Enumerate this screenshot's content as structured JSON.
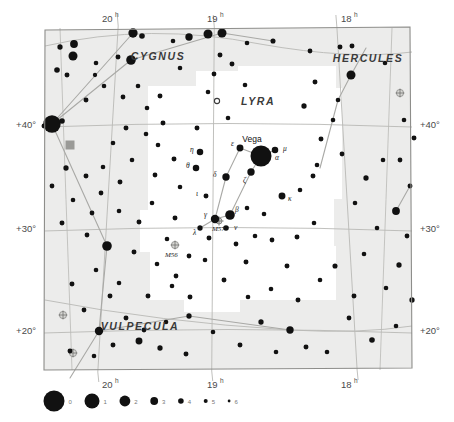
{
  "chart_data": {
    "type": "scatter",
    "xlabel": "Right Ascension",
    "ylabel": "Declination",
    "xlim": [
      20.5,
      17.5
    ],
    "ylim": [
      16,
      46
    ],
    "grid": true,
    "ra_ticks": [
      {
        "value": 20,
        "label": "20",
        "sup": "h",
        "x": 108
      },
      {
        "value": 19,
        "label": "19",
        "sup": "h",
        "x": 213
      },
      {
        "value": 18,
        "label": "18",
        "sup": "h",
        "x": 347
      }
    ],
    "dec_ticks": [
      {
        "value": 40,
        "label": "+40°",
        "y": 124
      },
      {
        "value": 30,
        "label": "+30°",
        "y": 228
      },
      {
        "value": 20,
        "label": "+20°",
        "y": 330
      }
    ],
    "constellations": [
      {
        "name": "CYGNUS",
        "x": 158,
        "y": 60
      },
      {
        "name": "HERCULES",
        "x": 368,
        "y": 62
      },
      {
        "name": "LYRA",
        "x": 258,
        "y": 105
      },
      {
        "name": "VULPECULA",
        "x": 140,
        "y": 330
      }
    ],
    "named_stars": [
      {
        "name": "Vega",
        "label": "α",
        "x": 261,
        "y": 156,
        "mag": 0,
        "label_x": 252,
        "label_y": 142,
        "greek_x": 275,
        "greek_y": 160
      }
    ],
    "greek_labels": [
      {
        "text": "η",
        "x": 190,
        "y": 152
      },
      {
        "text": "θ",
        "x": 186,
        "y": 168
      },
      {
        "text": "ι",
        "x": 196,
        "y": 196
      },
      {
        "text": "δ",
        "x": 213,
        "y": 177
      },
      {
        "text": "ε",
        "x": 231,
        "y": 146
      },
      {
        "text": "μ",
        "x": 283,
        "y": 151
      },
      {
        "text": "ζ",
        "x": 243,
        "y": 183
      },
      {
        "text": "κ",
        "x": 288,
        "y": 201
      },
      {
        "text": "γ",
        "x": 204,
        "y": 217
      },
      {
        "text": "β",
        "x": 235,
        "y": 212
      },
      {
        "text": "ν",
        "x": 234,
        "y": 230
      },
      {
        "text": "λ",
        "x": 193,
        "y": 235
      }
    ],
    "deep_sky": [
      {
        "name": "M57",
        "type": "planetary-nebula",
        "x": 219,
        "y": 221,
        "label_x": 212,
        "label_y": 231
      },
      {
        "name": "M56",
        "type": "globular-cluster",
        "x": 175,
        "y": 245,
        "label_x": 165,
        "label_y": 257
      }
    ],
    "legend": {
      "title": "magnitude",
      "items": [
        {
          "mag": "0",
          "r": 10.5
        },
        {
          "mag": "1",
          "r": 7.5
        },
        {
          "mag": "2",
          "r": 5.4
        },
        {
          "mag": "3",
          "r": 3.9
        },
        {
          "mag": "4",
          "r": 2.8
        },
        {
          "mag": "5",
          "r": 2.0
        },
        {
          "mag": "6",
          "r": 1.4
        }
      ]
    },
    "colors": {
      "background": "#ffffff",
      "sky_fill": "#ececeb",
      "inset_fill": "#ffffff",
      "star": "#111111",
      "grid": "#b9b9b5",
      "constellation_line": "#a9a9a6",
      "border": "#8d8d8a",
      "open_cluster": "#9a9a97",
      "text": "#2b2b2b"
    },
    "stars": [
      {
        "x": 52,
        "y": 124,
        "m": 0.6
      },
      {
        "x": 44,
        "y": 126,
        "m": 4.4
      },
      {
        "x": 62,
        "y": 121,
        "m": 4.0
      },
      {
        "x": 60,
        "y": 47,
        "m": 4.2
      },
      {
        "x": 74,
        "y": 44,
        "m": 3.0
      },
      {
        "x": 73,
        "y": 56,
        "m": 2.6
      },
      {
        "x": 57,
        "y": 70,
        "m": 4.0
      },
      {
        "x": 67,
        "y": 75,
        "m": 4.4
      },
      {
        "x": 96,
        "y": 63,
        "m": 4.6
      },
      {
        "x": 95,
        "y": 75,
        "m": 4.8
      },
      {
        "x": 118,
        "y": 57,
        "m": 4.4
      },
      {
        "x": 131,
        "y": 60,
        "m": 2.4
      },
      {
        "x": 133,
        "y": 33,
        "m": 2.5
      },
      {
        "x": 142,
        "y": 36,
        "m": 4.0
      },
      {
        "x": 173,
        "y": 41,
        "m": 4.6
      },
      {
        "x": 189,
        "y": 37,
        "m": 3.2
      },
      {
        "x": 208,
        "y": 34,
        "m": 2.6
      },
      {
        "x": 222,
        "y": 33,
        "m": 2.6
      },
      {
        "x": 220,
        "y": 55,
        "m": 4.4
      },
      {
        "x": 247,
        "y": 43,
        "m": 4.6
      },
      {
        "x": 273,
        "y": 41,
        "m": 4.3
      },
      {
        "x": 310,
        "y": 51,
        "m": 4.5
      },
      {
        "x": 340,
        "y": 47,
        "m": 4.4
      },
      {
        "x": 352,
        "y": 46,
        "m": 4.4
      },
      {
        "x": 385,
        "y": 63,
        "m": 4.6
      },
      {
        "x": 351,
        "y": 75,
        "m": 2.6
      },
      {
        "x": 315,
        "y": 82,
        "m": 4.4
      },
      {
        "x": 338,
        "y": 100,
        "m": 4.6
      },
      {
        "x": 304,
        "y": 106,
        "m": 4.2
      },
      {
        "x": 404,
        "y": 120,
        "m": 4.6
      },
      {
        "x": 414,
        "y": 138,
        "m": 4.4
      },
      {
        "x": 400,
        "y": 160,
        "m": 4.5
      },
      {
        "x": 410,
        "y": 186,
        "m": 4.4
      },
      {
        "x": 396,
        "y": 211,
        "m": 3.0
      },
      {
        "x": 407,
        "y": 236,
        "m": 4.5
      },
      {
        "x": 399,
        "y": 265,
        "m": 4.2
      },
      {
        "x": 386,
        "y": 288,
        "m": 4.6
      },
      {
        "x": 412,
        "y": 300,
        "m": 4.2
      },
      {
        "x": 396,
        "y": 326,
        "m": 4.6
      },
      {
        "x": 372,
        "y": 340,
        "m": 4.0
      },
      {
        "x": 349,
        "y": 318,
        "m": 4.5
      },
      {
        "x": 354,
        "y": 296,
        "m": 4.4
      },
      {
        "x": 335,
        "y": 266,
        "m": 4.3
      },
      {
        "x": 364,
        "y": 254,
        "m": 4.6
      },
      {
        "x": 377,
        "y": 228,
        "m": 4.6
      },
      {
        "x": 355,
        "y": 203,
        "m": 4.6
      },
      {
        "x": 366,
        "y": 178,
        "m": 4.2
      },
      {
        "x": 383,
        "y": 160,
        "m": 4.6
      },
      {
        "x": 342,
        "y": 154,
        "m": 4.5
      },
      {
        "x": 321,
        "y": 139,
        "m": 4.4
      },
      {
        "x": 333,
        "y": 120,
        "m": 4.6
      },
      {
        "x": 313,
        "y": 176,
        "m": 4.4
      },
      {
        "x": 317,
        "y": 165,
        "m": 4.6
      },
      {
        "x": 300,
        "y": 190,
        "m": 4.6
      },
      {
        "x": 297,
        "y": 237,
        "m": 4.4
      },
      {
        "x": 314,
        "y": 223,
        "m": 4.6
      },
      {
        "x": 287,
        "y": 266,
        "m": 4.4
      },
      {
        "x": 320,
        "y": 280,
        "m": 4.6
      },
      {
        "x": 298,
        "y": 300,
        "m": 4.4
      },
      {
        "x": 271,
        "y": 289,
        "m": 4.6
      },
      {
        "x": 261,
        "y": 322,
        "m": 4.2
      },
      {
        "x": 290,
        "y": 330,
        "m": 3.2
      },
      {
        "x": 306,
        "y": 347,
        "m": 4.4
      },
      {
        "x": 327,
        "y": 352,
        "m": 4.6
      },
      {
        "x": 276,
        "y": 352,
        "m": 4.6
      },
      {
        "x": 240,
        "y": 345,
        "m": 4.4
      },
      {
        "x": 213,
        "y": 332,
        "m": 4.6
      },
      {
        "x": 186,
        "y": 354,
        "m": 4.4
      },
      {
        "x": 160,
        "y": 348,
        "m": 4.2
      },
      {
        "x": 139,
        "y": 341,
        "m": 3.4
      },
      {
        "x": 113,
        "y": 345,
        "m": 4.4
      },
      {
        "x": 94,
        "y": 356,
        "m": 4.6
      },
      {
        "x": 70,
        "y": 351,
        "m": 4.4
      },
      {
        "x": 99,
        "y": 331,
        "m": 2.8
      },
      {
        "x": 126,
        "y": 318,
        "m": 4.4
      },
      {
        "x": 144,
        "y": 330,
        "m": 4.5
      },
      {
        "x": 166,
        "y": 322,
        "m": 4.6
      },
      {
        "x": 189,
        "y": 316,
        "m": 4.2
      },
      {
        "x": 110,
        "y": 296,
        "m": 4.4
      },
      {
        "x": 84,
        "y": 310,
        "m": 4.5
      },
      {
        "x": 72,
        "y": 284,
        "m": 4.4
      },
      {
        "x": 96,
        "y": 270,
        "m": 4.6
      },
      {
        "x": 119,
        "y": 283,
        "m": 4.6
      },
      {
        "x": 148,
        "y": 296,
        "m": 4.4
      },
      {
        "x": 172,
        "y": 286,
        "m": 4.6
      },
      {
        "x": 190,
        "y": 297,
        "m": 4.4
      },
      {
        "x": 157,
        "y": 264,
        "m": 4.6
      },
      {
        "x": 134,
        "y": 252,
        "m": 4.4
      },
      {
        "x": 107,
        "y": 246,
        "m": 2.4
      },
      {
        "x": 87,
        "y": 235,
        "m": 4.5
      },
      {
        "x": 62,
        "y": 223,
        "m": 4.4
      },
      {
        "x": 73,
        "y": 200,
        "m": 4.6
      },
      {
        "x": 92,
        "y": 213,
        "m": 4.5
      },
      {
        "x": 52,
        "y": 186,
        "m": 4.5
      },
      {
        "x": 66,
        "y": 168,
        "m": 4.2
      },
      {
        "x": 86,
        "y": 176,
        "m": 4.4
      },
      {
        "x": 103,
        "y": 167,
        "m": 4.6
      },
      {
        "x": 120,
        "y": 182,
        "m": 4.4
      },
      {
        "x": 101,
        "y": 193,
        "m": 4.5
      },
      {
        "x": 132,
        "y": 160,
        "m": 4.6
      },
      {
        "x": 113,
        "y": 143,
        "m": 4.6
      },
      {
        "x": 126,
        "y": 128,
        "m": 4.4
      },
      {
        "x": 146,
        "y": 134,
        "m": 4.6
      },
      {
        "x": 163,
        "y": 123,
        "m": 4.4
      },
      {
        "x": 147,
        "y": 108,
        "m": 4.6
      },
      {
        "x": 123,
        "y": 97,
        "m": 4.5
      },
      {
        "x": 104,
        "y": 86,
        "m": 4.6
      },
      {
        "x": 86,
        "y": 100,
        "m": 4.4
      },
      {
        "x": 138,
        "y": 86,
        "m": 4.6
      },
      {
        "x": 160,
        "y": 96,
        "m": 4.4
      },
      {
        "x": 152,
        "y": 203,
        "m": 4.6
      },
      {
        "x": 139,
        "y": 222,
        "m": 4.4
      },
      {
        "x": 119,
        "y": 211,
        "m": 4.6
      },
      {
        "x": 155,
        "y": 175,
        "m": 4.5
      },
      {
        "x": 174,
        "y": 159,
        "m": 4.4
      },
      {
        "x": 180,
        "y": 187,
        "m": 4.6
      },
      {
        "x": 208,
        "y": 92,
        "m": 4.6
      },
      {
        "x": 197,
        "y": 128,
        "m": 4.4
      },
      {
        "x": 228,
        "y": 118,
        "m": 4.6
      },
      {
        "x": 214,
        "y": 74,
        "m": 4.5
      },
      {
        "x": 245,
        "y": 85,
        "m": 4.6
      },
      {
        "x": 232,
        "y": 64,
        "m": 4.4
      },
      {
        "x": 180,
        "y": 68,
        "m": 4.6
      },
      {
        "x": 200,
        "y": 152,
        "m": 3.6
      },
      {
        "x": 196,
        "y": 168,
        "m": 3.6
      },
      {
        "x": 206,
        "y": 196,
        "m": 4.4
      },
      {
        "x": 226,
        "y": 177,
        "m": 3.2
      },
      {
        "x": 240,
        "y": 148,
        "m": 3.4
      },
      {
        "x": 275,
        "y": 150,
        "m": 3.6
      },
      {
        "x": 251,
        "y": 172,
        "m": 3.2
      },
      {
        "x": 282,
        "y": 196,
        "m": 3.4
      },
      {
        "x": 215,
        "y": 219,
        "m": 2.8
      },
      {
        "x": 230,
        "y": 215,
        "m": 2.4
      },
      {
        "x": 226,
        "y": 228,
        "m": 4.0
      },
      {
        "x": 200,
        "y": 228,
        "m": 4.2
      },
      {
        "x": 209,
        "y": 238,
        "m": 4.4
      },
      {
        "x": 236,
        "y": 244,
        "m": 4.5
      },
      {
        "x": 255,
        "y": 236,
        "m": 4.6
      },
      {
        "x": 175,
        "y": 218,
        "m": 4.4
      },
      {
        "x": 167,
        "y": 239,
        "m": 4.6
      },
      {
        "x": 189,
        "y": 256,
        "m": 4.5
      },
      {
        "x": 246,
        "y": 262,
        "m": 4.4
      },
      {
        "x": 264,
        "y": 214,
        "m": 4.6
      },
      {
        "x": 272,
        "y": 240,
        "m": 4.5
      },
      {
        "x": 158,
        "y": 145,
        "m": 4.6
      },
      {
        "x": 247,
        "y": 208,
        "m": 4.6
      },
      {
        "x": 205,
        "y": 260,
        "m": 4.6
      },
      {
        "x": 224,
        "y": 280,
        "m": 4.4
      },
      {
        "x": 248,
        "y": 297,
        "m": 4.6
      },
      {
        "x": 176,
        "y": 276,
        "m": 4.5
      }
    ],
    "variable_stars": [
      {
        "x": 217,
        "y": 101,
        "r": 2.6
      }
    ],
    "open_clusters": [
      {
        "x": 70,
        "y": 145,
        "size": 9
      }
    ],
    "globular_clusters": [
      {
        "x": 175,
        "y": 245
      },
      {
        "x": 73,
        "y": 353
      },
      {
        "x": 400,
        "y": 93
      },
      {
        "x": 63,
        "y": 315
      }
    ],
    "constellation_lines": [
      [
        [
          52,
          124
        ],
        [
          133,
          33
        ]
      ],
      [
        [
          52,
          124
        ],
        [
          131,
          60
        ]
      ],
      [
        [
          52,
          124
        ],
        [
          107,
          246
        ]
      ],
      [
        [
          107,
          246
        ],
        [
          99,
          331
        ]
      ],
      [
        [
          99,
          331
        ],
        [
          70,
          378
        ]
      ],
      [
        [
          131,
          60
        ],
        [
          222,
          33
        ]
      ],
      [
        [
          222,
          33
        ],
        [
          273,
          41
        ]
      ],
      [
        [
          351,
          75
        ],
        [
          338,
          100
        ]
      ],
      [
        [
          338,
          100
        ],
        [
          320,
          168
        ]
      ],
      [
        [
          351,
          75
        ],
        [
          366,
          48
        ]
      ],
      [
        [
          396,
          211
        ],
        [
          410,
          186
        ]
      ],
      [
        [
          261,
          156
        ],
        [
          240,
          148
        ]
      ],
      [
        [
          240,
          148
        ],
        [
          226,
          177
        ]
      ],
      [
        [
          226,
          177
        ],
        [
          215,
          219
        ]
      ],
      [
        [
          215,
          219
        ],
        [
          230,
          215
        ]
      ],
      [
        [
          230,
          215
        ],
        [
          251,
          172
        ]
      ],
      [
        [
          251,
          172
        ],
        [
          261,
          156
        ]
      ],
      [
        [
          275,
          150
        ],
        [
          261,
          156
        ]
      ],
      [
        [
          215,
          219
        ],
        [
          200,
          228
        ]
      ],
      [
        [
          99,
          331
        ],
        [
          189,
          316
        ]
      ],
      [
        [
          189,
          316
        ],
        [
          290,
          330
        ]
      ]
    ],
    "sky_polygon": "45,30 410,27 412,368 44,370",
    "inset_polygon": "148,118 148,86 196,86 196,71 238,71 238,66 336,66 336,88 342,88 342,199 334,199 334,246 336,246 336,300 240,300 240,312 184,312 184,300 150,300 150,252 140,252 140,210 148,210"
  }
}
